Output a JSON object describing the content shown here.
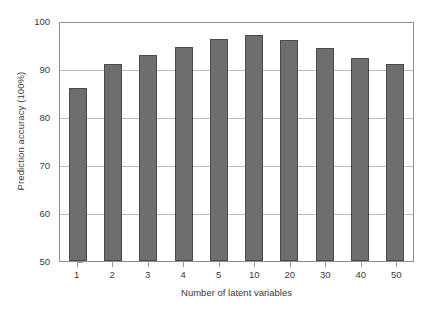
{
  "chart_data": {
    "type": "bar",
    "title": "",
    "categories": [
      "1",
      "2",
      "3",
      "4",
      "5",
      "10",
      "20",
      "30",
      "40",
      "50"
    ],
    "values": [
      86,
      91,
      93,
      94.5,
      96.3,
      97,
      96,
      94.3,
      92.3,
      91
    ],
    "series": [
      {
        "name": "Prediction accuracy",
        "values": [
          86,
          91,
          93,
          94.5,
          96.3,
          97,
          96,
          94.3,
          92.3,
          91
        ]
      }
    ],
    "xlabel": "Number of latent variables",
    "ylabel": "Prediction accuracy (100%)",
    "ylim": [
      50,
      100
    ],
    "yticks": [
      50,
      60,
      70,
      80,
      90,
      100
    ],
    "ytick_labels": [
      "50",
      "60",
      "70",
      "80",
      "90",
      "100"
    ],
    "grid": "horizontal",
    "legend": "none",
    "bar_color": "#6e6e6e",
    "bar_edge_color": "#4a4a4a",
    "grid_color": "#b9b9b9",
    "axis_color": "#8d8d8d",
    "background": "#ffffff"
  }
}
